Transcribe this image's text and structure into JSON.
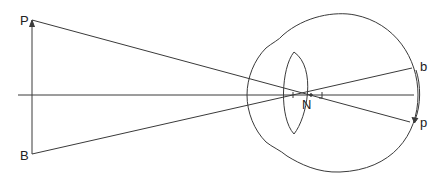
{
  "diagram": {
    "type": "optics-eye-nodal-point",
    "labels": {
      "object_top": "P",
      "object_bottom": "B",
      "nodal_point": "N",
      "image_top": "b",
      "image_bottom": "p"
    },
    "colors": {
      "line": "#333333",
      "background": "#ffffff"
    }
  }
}
